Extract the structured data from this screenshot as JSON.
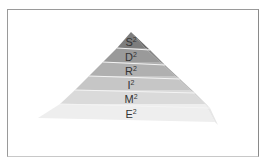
{
  "diagram": {
    "type": "pyramid",
    "levels": [
      {
        "label": "S",
        "sup": "2",
        "color": "#7d7d7d",
        "side": "#6a6a6a"
      },
      {
        "label": "D",
        "sup": "2",
        "color": "#9a9a9a",
        "side": "#878787"
      },
      {
        "label": "R",
        "sup": "2",
        "color": "#b0b0b0",
        "side": "#a0a0a0"
      },
      {
        "label": "I",
        "sup": "2",
        "color": "#c6c6c6",
        "side": "#b8b8b8"
      },
      {
        "label": "M",
        "sup": "2",
        "color": "#dadada",
        "side": "#cfcfcf"
      },
      {
        "label": "E",
        "sup": "2",
        "color": "#eeeeee",
        "side": "#e6e6e6"
      }
    ]
  }
}
